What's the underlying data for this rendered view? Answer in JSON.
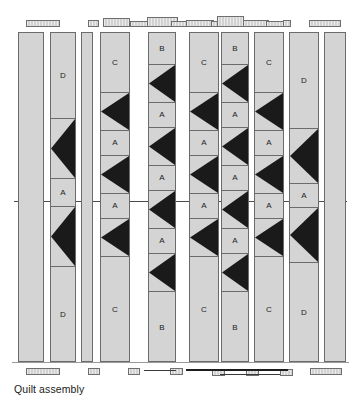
{
  "figure": {
    "caption": "Quilt assembly",
    "kind": "quilt-assembly-diagram",
    "colors": {
      "fabric_light": "#d4d4d4",
      "fabric_dark": "#1a1a1a",
      "outline": "#6b6b6b",
      "rule": "#4c4c4c",
      "page": "#ffffff"
    },
    "labels": {
      "a": "A",
      "b": "B",
      "c": "C",
      "d": "D"
    }
  },
  "columns": [
    {
      "id": 1,
      "name": "column-1-plain-strip",
      "x": 18,
      "w": 26,
      "blocks": [
        {
          "type": "plain",
          "label": "",
          "h": 330
        }
      ]
    },
    {
      "id": 2,
      "name": "column-2-sashing-D",
      "x": 50,
      "w": 26,
      "blocks": [
        {
          "type": "plain",
          "label": "D",
          "h": 86
        },
        {
          "type": "hst",
          "label": "",
          "h": 60
        },
        {
          "type": "plain",
          "label": "A",
          "h": 28
        },
        {
          "type": "hst",
          "label": "",
          "h": 60
        },
        {
          "type": "plain",
          "label": "D",
          "h": 96
        }
      ]
    },
    {
      "id": 3,
      "name": "column-3-plain-strip",
      "x": 81,
      "w": 12,
      "blocks": [
        {
          "type": "plain",
          "label": "",
          "h": 330
        }
      ]
    },
    {
      "id": 4,
      "name": "column-4-pieced-C",
      "x": 100,
      "w": 30,
      "blocks": [
        {
          "type": "plain",
          "label": "C",
          "h": 60
        },
        {
          "type": "hst",
          "label": "",
          "h": 38
        },
        {
          "type": "plain",
          "label": "A",
          "h": 25
        },
        {
          "type": "hst",
          "label": "",
          "h": 38
        },
        {
          "type": "plain",
          "label": "A",
          "h": 25
        },
        {
          "type": "hst",
          "label": "",
          "h": 38
        },
        {
          "type": "plain",
          "label": "C",
          "h": 106
        }
      ]
    },
    {
      "id": 5,
      "name": "column-5-pieced-B",
      "x": 148,
      "w": 28,
      "blocks": [
        {
          "type": "plain",
          "label": "B",
          "h": 32
        },
        {
          "type": "hst",
          "label": "",
          "h": 38
        },
        {
          "type": "plain",
          "label": "A",
          "h": 25
        },
        {
          "type": "hst",
          "label": "",
          "h": 38
        },
        {
          "type": "plain",
          "label": "A",
          "h": 25
        },
        {
          "type": "hst",
          "label": "",
          "h": 38
        },
        {
          "type": "plain",
          "label": "A",
          "h": 25
        },
        {
          "type": "hst",
          "label": "",
          "h": 38
        },
        {
          "type": "plain",
          "label": "B",
          "h": 71
        }
      ]
    },
    {
      "id": 6,
      "name": "column-6-pieced-C",
      "x": 189,
      "w": 30,
      "blocks": [
        {
          "type": "plain",
          "label": "C",
          "h": 60
        },
        {
          "type": "hst",
          "label": "",
          "h": 38
        },
        {
          "type": "plain",
          "label": "A",
          "h": 25
        },
        {
          "type": "hst",
          "label": "",
          "h": 38
        },
        {
          "type": "plain",
          "label": "A",
          "h": 25
        },
        {
          "type": "hst",
          "label": "",
          "h": 38
        },
        {
          "type": "plain",
          "label": "C",
          "h": 106
        }
      ]
    },
    {
      "id": 7,
      "name": "column-7-pieced-B",
      "x": 221,
      "w": 28,
      "blocks": [
        {
          "type": "plain",
          "label": "B",
          "h": 32
        },
        {
          "type": "hst",
          "label": "",
          "h": 38
        },
        {
          "type": "plain",
          "label": "A",
          "h": 25
        },
        {
          "type": "hst",
          "label": "",
          "h": 38
        },
        {
          "type": "plain",
          "label": "A",
          "h": 25
        },
        {
          "type": "hst",
          "label": "",
          "h": 38
        },
        {
          "type": "plain",
          "label": "A",
          "h": 25
        },
        {
          "type": "hst",
          "label": "",
          "h": 38
        },
        {
          "type": "plain",
          "label": "B",
          "h": 71
        }
      ]
    },
    {
      "id": 8,
      "name": "column-8-pieced-C",
      "x": 254,
      "w": 30,
      "blocks": [
        {
          "type": "plain",
          "label": "C",
          "h": 60
        },
        {
          "type": "hst",
          "label": "",
          "h": 38
        },
        {
          "type": "plain",
          "label": "A",
          "h": 25
        },
        {
          "type": "hst",
          "label": "",
          "h": 38
        },
        {
          "type": "plain",
          "label": "A",
          "h": 25
        },
        {
          "type": "hst",
          "label": "",
          "h": 38
        },
        {
          "type": "plain",
          "label": "C",
          "h": 106
        }
      ]
    },
    {
      "id": 9,
      "name": "column-9-sashing-D",
      "x": 289,
      "w": 30,
      "blocks": [
        {
          "type": "plain",
          "label": "D",
          "h": 96
        },
        {
          "type": "hst",
          "label": "",
          "h": 55
        },
        {
          "type": "plain",
          "label": "A",
          "h": 24
        },
        {
          "type": "hst",
          "label": "",
          "h": 55
        },
        {
          "type": "plain",
          "label": "D",
          "h": 100
        }
      ]
    },
    {
      "id": 10,
      "name": "column-10-plain-strip",
      "x": 324,
      "w": 22,
      "blocks": [
        {
          "type": "plain",
          "label": "",
          "h": 330
        }
      ]
    }
  ],
  "top_markers": [
    {
      "name": "marker-top-1",
      "x": 26,
      "y": 20,
      "w": 34,
      "h": 7
    },
    {
      "name": "marker-top-2",
      "x": 88,
      "y": 20,
      "w": 11,
      "h": 7
    },
    {
      "name": "marker-top-3",
      "x": 103,
      "y": 18,
      "w": 27,
      "h": 9
    },
    {
      "name": "marker-top-4",
      "x": 130,
      "y": 21,
      "w": 22,
      "h": 6
    },
    {
      "name": "marker-top-5",
      "x": 147,
      "y": 17,
      "w": 31,
      "h": 10
    },
    {
      "name": "marker-top-6",
      "x": 171,
      "y": 21,
      "w": 16,
      "h": 6
    },
    {
      "name": "marker-top-7",
      "x": 186,
      "y": 20,
      "w": 28,
      "h": 7
    },
    {
      "name": "marker-top-8",
      "x": 211,
      "y": 21,
      "w": 22,
      "h": 6
    },
    {
      "name": "marker-top-9",
      "x": 217,
      "y": 16,
      "w": 27,
      "h": 11
    },
    {
      "name": "marker-top-10",
      "x": 243,
      "y": 20,
      "w": 26,
      "h": 7
    },
    {
      "name": "marker-top-11",
      "x": 266,
      "y": 21,
      "w": 22,
      "h": 6
    },
    {
      "name": "marker-top-12",
      "x": 283,
      "y": 20,
      "w": 8,
      "h": 7
    },
    {
      "name": "marker-top-13",
      "x": 309,
      "y": 20,
      "w": 32,
      "h": 7
    }
  ],
  "bottom_markers": [
    {
      "name": "marker-bottom-1",
      "x": 26,
      "y": 368,
      "w": 34,
      "h": 7
    },
    {
      "name": "marker-bottom-2",
      "x": 88,
      "y": 368,
      "w": 12,
      "h": 7
    },
    {
      "name": "marker-bottom-3",
      "x": 128,
      "y": 368,
      "w": 12,
      "h": 7
    },
    {
      "name": "marker-bottom-4",
      "x": 170,
      "y": 368,
      "w": 13,
      "h": 7
    },
    {
      "name": "marker-bottom-5",
      "x": 212,
      "y": 369,
      "w": 13,
      "h": 7
    },
    {
      "name": "marker-bottom-6",
      "x": 246,
      "y": 369,
      "w": 13,
      "h": 7
    },
    {
      "name": "marker-bottom-7",
      "x": 280,
      "y": 369,
      "w": 13,
      "h": 7
    },
    {
      "name": "marker-bottom-8",
      "x": 310,
      "y": 368,
      "w": 32,
      "h": 7
    }
  ],
  "bottom_rules": [
    {
      "name": "arrow-rule-1",
      "x": 144,
      "y": 370,
      "w": 32,
      "thick": false
    },
    {
      "name": "arrow-rule-2",
      "x": 186,
      "y": 369,
      "w": 102,
      "thick": true
    },
    {
      "name": "arrow-rule-3",
      "x": 220,
      "y": 374,
      "w": 60,
      "thick": false
    }
  ],
  "center_rule": {
    "name": "center-guide-rule",
    "y": 201
  },
  "baseline_rule": {
    "name": "baseline-guide-rule",
    "y": 362
  }
}
